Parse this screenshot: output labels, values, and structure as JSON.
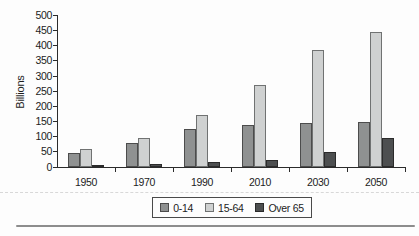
{
  "chart_data": {
    "type": "bar",
    "title": "",
    "ylabel": "Billions",
    "xlabel": "",
    "categories": [
      "1950",
      "1970",
      "1990",
      "2010",
      "2030",
      "2050"
    ],
    "series": [
      {
        "name": "0-14",
        "color": "#8f9191",
        "border_color": "#4c4c4c",
        "values": [
          45,
          80,
          125,
          140,
          145,
          150
        ]
      },
      {
        "name": "15-64",
        "color": "#cfd1d1",
        "border_color": "#707272",
        "values": [
          60,
          95,
          170,
          270,
          385,
          445
        ]
      },
      {
        "name": "Over 65",
        "color": "#4d4f50",
        "border_color": "#2b2b2b",
        "values": [
          5,
          10,
          15,
          22,
          48,
          95
        ]
      }
    ],
    "ylim": [
      0,
      500
    ],
    "ytick_step": 50,
    "grid": false,
    "legend_position": "bottom-center",
    "axis_color": "#2b2b2b",
    "background": "#fdfdfd"
  }
}
